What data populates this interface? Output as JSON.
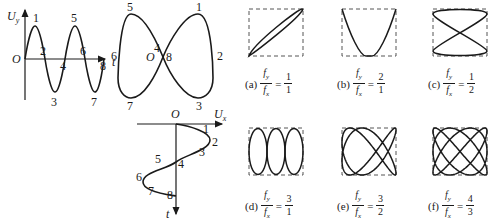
{
  "figure": {
    "time_wave": {
      "axis_y_label": "U_y",
      "axis_x_label": "t",
      "origin_label": "O",
      "point_labels": [
        "1",
        "2",
        "3",
        "4",
        "5",
        "6",
        "7",
        "8"
      ]
    },
    "figure_eight": {
      "origin_label": "O",
      "point_labels": [
        "1",
        "2",
        "3",
        "4",
        "5",
        "6",
        "7",
        "8"
      ]
    },
    "time_wave_x": {
      "axis_x_label": "U_x",
      "axis_y_label": "t",
      "origin_label": "O",
      "point_labels": [
        "1",
        "2",
        "3",
        "4",
        "5",
        "6",
        "7",
        "8"
      ]
    },
    "lissajous": [
      {
        "id": "a",
        "caption": "(a)",
        "num_sym": "f_y",
        "den_sym": "f_x",
        "ratio_num": "1",
        "ratio_den": "1"
      },
      {
        "id": "b",
        "caption": "(b)",
        "num_sym": "f_y",
        "den_sym": "f_x",
        "ratio_num": "2",
        "ratio_den": "1"
      },
      {
        "id": "c",
        "caption": "(c)",
        "num_sym": "f_y",
        "den_sym": "f_x",
        "ratio_num": "1",
        "ratio_den": "2"
      },
      {
        "id": "d",
        "caption": "(d)",
        "num_sym": "f_y",
        "den_sym": "f_x",
        "ratio_num": "3",
        "ratio_den": "1"
      },
      {
        "id": "e",
        "caption": "(e)",
        "num_sym": "f_y",
        "den_sym": "f_x",
        "ratio_num": "3",
        "ratio_den": "2"
      },
      {
        "id": "f",
        "caption": "(f)",
        "num_sym": "f_y",
        "den_sym": "f_x",
        "ratio_num": "4",
        "ratio_den": "3"
      }
    ],
    "equals_sign": "="
  }
}
